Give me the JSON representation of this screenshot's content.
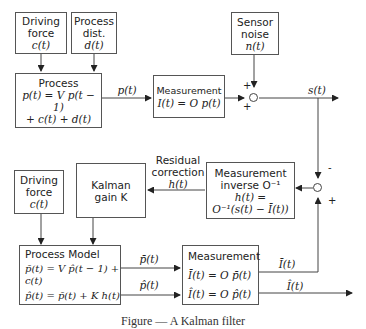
{
  "blocks": {
    "driving_force_top": {
      "line1": "Driving",
      "line2": "force",
      "line3": "c(t)"
    },
    "process_dist": {
      "line1": "Process",
      "line2": "dist.",
      "line3": "d(t)"
    },
    "sensor_noise": {
      "line1": "Sensor",
      "line2": "noise",
      "line3": "n(t)"
    },
    "process": {
      "line1": "Process",
      "line2": "p(t) = V p(t − 1)",
      "line3": "+ c(t) + d(t)"
    },
    "measurement_top": {
      "line1": "Measurement",
      "line2": "I(t) = O p(t)"
    },
    "driving_force_bottom": {
      "line1": "Driving",
      "line2": "force",
      "line3": "c(t)"
    },
    "kalman_gain": {
      "line1": "Kalman",
      "line2": "gain K"
    },
    "measurement_inverse": {
      "line1": "Measurement",
      "line2": "inverse O⁻¹",
      "line3": "h(t) =",
      "line4": "O⁻¹(s(t) − Ī(t))"
    },
    "process_model": {
      "line1": "Process Model",
      "line2": "p̄(t) = V p̂(t − 1) + c(t)",
      "line3": "p̂(t)  =  p̄(t) + K h(t)"
    },
    "measurement_bottom": {
      "line1": "Measurement",
      "line2": "Ī(t) = O p̄(t)",
      "line3": "Î(t) = O p̂(t)"
    }
  },
  "signals": {
    "p_t": "p(t)",
    "s_t": "s(t)",
    "residual_1": "Residual",
    "residual_2": "correction",
    "residual_3": "h(t)",
    "p_bar": "p̄(t)",
    "p_hat": "p̂(t)",
    "i_bar": "Ī(t)",
    "i_hat": "Î(t)"
  },
  "signs": {
    "noise_plus": "+",
    "meas_plus": "+",
    "s_minus": "-",
    "ibar_plus": "+"
  },
  "caption": "Figure — A Kalman filter"
}
